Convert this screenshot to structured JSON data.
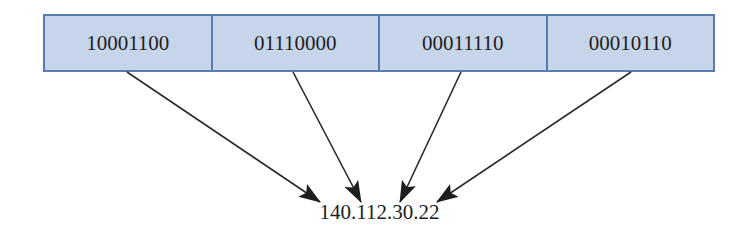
{
  "diagram": {
    "octets": [
      {
        "binary": "10001100",
        "decimal": 140
      },
      {
        "binary": "01110000",
        "decimal": 112
      },
      {
        "binary": "00011110",
        "decimal": 30
      },
      {
        "binary": "00010110",
        "decimal": 22
      }
    ],
    "dotted_decimal": "140.112.30.22",
    "colors": {
      "cell_fill": "#c7d5ea",
      "cell_border": "#5a7bb0",
      "arrow": "#2a2a2a",
      "text": "#1e1e1e"
    }
  }
}
